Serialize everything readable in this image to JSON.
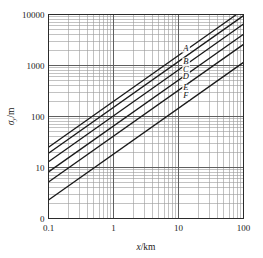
{
  "chart_data": {
    "type": "line",
    "title": "",
    "subtitle": "",
    "xlabel": "x/km",
    "ylabel": "σy/m",
    "xlabel_parts": {
      "italic": "x",
      "rest": "/km"
    },
    "ylabel_parts": {
      "symbol": "σ",
      "sub": "y",
      "rest": "/m"
    },
    "xscale": "log",
    "yscale": "log",
    "xlim": [
      0.1,
      100
    ],
    "ylim": [
      1,
      10000
    ],
    "grid": "major-and-minor",
    "legend": "inline-curve-labels",
    "origin_mark": "0",
    "xticks": [
      0.1,
      1,
      10,
      100
    ],
    "xtick_labels": [
      "0.1",
      "1",
      "10",
      "100"
    ],
    "yticks": [
      10,
      100,
      1000,
      10000
    ],
    "ytick_labels": [
      "10",
      "100",
      "1000",
      "10000"
    ],
    "series": [
      {
        "name": "A",
        "label": "A",
        "slope": 0.9,
        "y_at_x0p1": 25.0,
        "points": [
          [
            0.1,
            25
          ],
          [
            1,
            198
          ],
          [
            10,
            1580
          ],
          [
            100,
            12500
          ]
        ]
      },
      {
        "name": "B",
        "label": "B",
        "slope": 0.9,
        "y_at_x0p1": 19.0,
        "points": [
          [
            0.1,
            19
          ],
          [
            1,
            151
          ],
          [
            10,
            1200
          ],
          [
            100,
            9500
          ]
        ]
      },
      {
        "name": "C",
        "label": "C",
        "slope": 0.9,
        "y_at_x0p1": 13.0,
        "points": [
          [
            0.1,
            13
          ],
          [
            1,
            103
          ],
          [
            10,
            820
          ],
          [
            100,
            6500
          ]
        ]
      },
      {
        "name": "D",
        "label": "D",
        "slope": 0.9,
        "y_at_x0p1": 8.2,
        "points": [
          [
            0.1,
            8.2
          ],
          [
            1,
            65
          ],
          [
            10,
            518
          ],
          [
            100,
            4100
          ]
        ]
      },
      {
        "name": "E",
        "label": "E",
        "slope": 0.9,
        "y_at_x0p1": 5.2,
        "points": [
          [
            0.1,
            5.2
          ],
          [
            1,
            41
          ],
          [
            10,
            328
          ],
          [
            100,
            2600
          ]
        ]
      },
      {
        "name": "F",
        "label": "F",
        "slope": 0.9,
        "y_at_x0p1": 2.3,
        "points": [
          [
            0.1,
            2.3
          ],
          [
            1,
            18
          ],
          [
            10,
            145
          ],
          [
            100,
            1150
          ]
        ]
      }
    ],
    "curve_label_positions": [
      {
        "name": "A",
        "x": 13.0,
        "y": 1950
      },
      {
        "name": "B",
        "x": 13.0,
        "y": 1080
      },
      {
        "name": "C",
        "x": 13.0,
        "y": 760
      },
      {
        "name": "D",
        "x": 13.0,
        "y": 540
      },
      {
        "name": "E",
        "x": 13.0,
        "y": 330
      },
      {
        "name": "F",
        "x": 13.0,
        "y": 235
      }
    ],
    "colors": {
      "curve": "#1a1a1a",
      "frame": "#2b2b2b",
      "major_grid": "#5f5f5f",
      "minor_grid": "#9a9a9a",
      "background": "#ffffff",
      "text": "#222222"
    }
  }
}
